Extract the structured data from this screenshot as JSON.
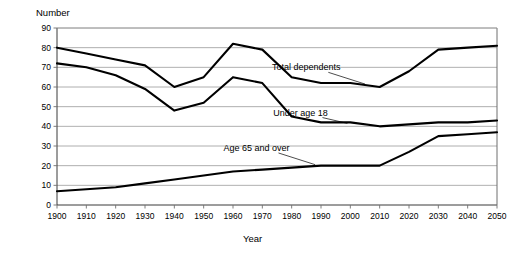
{
  "chart_data": {
    "type": "line",
    "title": "",
    "xlabel": "Year",
    "ylabel": "Number",
    "xlim": [
      1900,
      2050
    ],
    "ylim": [
      0,
      90
    ],
    "grid": true,
    "legend_position": "inline-annotations",
    "x": [
      1900,
      1910,
      1920,
      1930,
      1940,
      1950,
      1960,
      1970,
      1980,
      1990,
      2000,
      2010,
      2020,
      2030,
      2040,
      2050
    ],
    "xticklabels": [
      "1900",
      "1910",
      "1920",
      "1930",
      "1940",
      "1950",
      "1960",
      "1970",
      "1980",
      "1990",
      "2000",
      "2010",
      "2020",
      "2030",
      "2040",
      "2050"
    ],
    "yticklabels": [
      "0",
      "10",
      "20",
      "30",
      "40",
      "50",
      "60",
      "70",
      "80",
      "90"
    ],
    "yticks": [
      0,
      10,
      20,
      30,
      40,
      50,
      60,
      70,
      80,
      90
    ],
    "series": [
      {
        "name": "Total dependents",
        "values": [
          80,
          77,
          74,
          71,
          60,
          65,
          82,
          79,
          65,
          62,
          62,
          60,
          68,
          79,
          80,
          81
        ]
      },
      {
        "name": "Under age 18",
        "values": [
          72,
          70,
          66,
          59,
          48,
          52,
          65,
          62,
          45,
          42,
          42,
          40,
          41,
          42,
          42,
          43
        ]
      },
      {
        "name": "Age 65 and over",
        "values": [
          7,
          8,
          9,
          11,
          13,
          15,
          17,
          18,
          19,
          20,
          20,
          20,
          27,
          35,
          36,
          37
        ]
      }
    ],
    "annotations": [
      {
        "text": "Total dependents",
        "x": 1985,
        "y": 70
      },
      {
        "text": "Under age 18",
        "x": 1983,
        "y": 47
      },
      {
        "text": "Age 65 and over",
        "x": 1968,
        "y": 29
      }
    ]
  }
}
